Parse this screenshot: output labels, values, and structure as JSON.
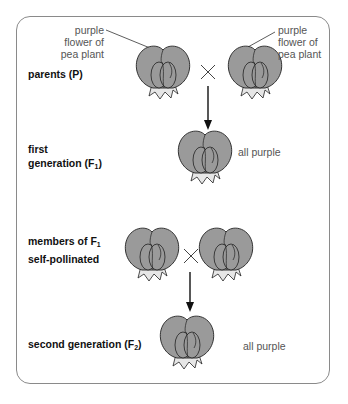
{
  "diagram": {
    "labels": {
      "parents": "parents (P)",
      "first_generation_line1": "first",
      "first_generation_line2": "generation (F",
      "first_generation_sub": "1",
      "first_generation_close": ")",
      "members_line1": "members of F",
      "members_sub": "1",
      "members_line2": "self-pollinated",
      "second_generation": "second generation (F",
      "second_generation_sub": "2",
      "second_generation_close": ")"
    },
    "annotations": {
      "left_flower_line1": "purple",
      "left_flower_line2": "flower of",
      "left_flower_line3": "pea plant",
      "right_flower_line1": "purple",
      "right_flower_line2": "flower of",
      "right_flower_line3": "pea plant",
      "f1_result": "all purple",
      "f2_result": "all purple"
    },
    "symbols": {
      "cross": "×"
    },
    "colors": {
      "petal": "#9a9a9a",
      "outline": "#222222",
      "sepal": "#e6e6e6",
      "frame": "#8a8a8a"
    }
  }
}
